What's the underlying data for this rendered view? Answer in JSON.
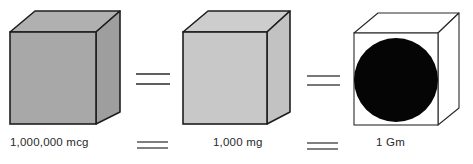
{
  "diagram": {
    "items": [
      {
        "label": "1,000,000 mcg",
        "fill": "#a9a9a9",
        "side_fill": "#9c9c9c",
        "top_fill": "#b3b3b3",
        "content": "none"
      },
      {
        "label": "1,000 mg",
        "fill": "#c7c7c7",
        "side_fill": "#bdbdbd",
        "top_fill": "#cfcfcf",
        "content": "none"
      },
      {
        "label": "1 Gm",
        "fill": "#ffffff",
        "side_fill": "#ffffff",
        "top_fill": "#ffffff",
        "content": "black-circle"
      }
    ],
    "operators": [
      "=",
      "="
    ],
    "stroke_color": "#1e1e1e",
    "circle_color": "#050505"
  }
}
